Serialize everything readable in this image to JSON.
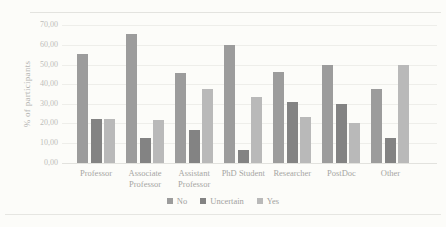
{
  "chart_data": {
    "type": "bar",
    "title": "",
    "xlabel": "",
    "ylabel": "% of participants",
    "ylim": [
      0,
      70
    ],
    "ytick_step": 10,
    "ytick_labels": [
      "0,00",
      "10,00",
      "20,00",
      "30,00",
      "40,00",
      "50,00",
      "60,00",
      "70,00"
    ],
    "grid": true,
    "legend_position": "bottom-center",
    "categories": [
      "Professor",
      "Associate Professor",
      "Assistant Professor",
      "PhD Student",
      "Researcher",
      "PostDoc",
      "Other"
    ],
    "series": [
      {
        "name": "No",
        "color": "#9c9c9c",
        "values": [
          55.56,
          65.63,
          45.83,
          60.0,
          46.15,
          50.0,
          37.5
        ]
      },
      {
        "name": "Uncertain",
        "color": "#838383",
        "values": [
          22.22,
          12.5,
          16.67,
          6.67,
          30.77,
          30.0,
          12.5
        ]
      },
      {
        "name": "Yes",
        "color": "#b9b9b9",
        "values": [
          22.22,
          21.88,
          37.5,
          33.33,
          23.08,
          20.0,
          50.0
        ]
      }
    ]
  }
}
